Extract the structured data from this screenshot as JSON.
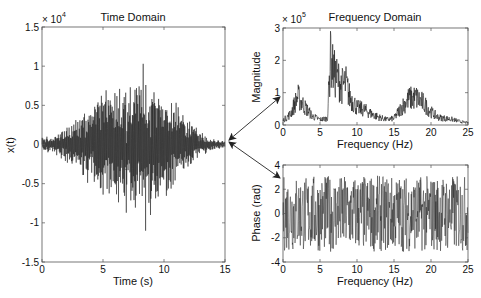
{
  "chart_data": [
    {
      "id": "time",
      "type": "line",
      "title": "Time Domain",
      "xlabel": "Time (s)",
      "ylabel": "x(t)",
      "y_multiplier": "× 10",
      "y_exponent": "4",
      "xlim": [
        0,
        15
      ],
      "ylim": [
        -1.5,
        1.5
      ],
      "xticks": [
        "0",
        "5",
        "10",
        "15"
      ],
      "yticks": [
        "-1.5",
        "-1",
        "-0.5",
        "0",
        "0.5",
        "1",
        "1.5"
      ],
      "grid": false,
      "envelope": {
        "t": [
          0,
          1,
          2,
          3,
          4,
          5,
          6,
          7,
          8,
          9,
          10,
          11,
          12,
          13,
          14,
          15
        ],
        "amp": [
          0.08,
          0.1,
          0.2,
          0.3,
          0.45,
          0.6,
          0.65,
          0.72,
          0.72,
          0.7,
          0.6,
          0.45,
          0.28,
          0.15,
          0.06,
          0.04
        ]
      },
      "peaks": [
        {
          "t": 8.3,
          "value": 1.03
        },
        {
          "t": 8.5,
          "value": -1.1
        },
        {
          "t": 6.9,
          "value": -0.87
        },
        {
          "t": 8.9,
          "value": -0.9
        }
      ]
    },
    {
      "id": "magnitude",
      "type": "line",
      "title": "Frequency Domain",
      "xlabel": "Frequency (Hz)",
      "ylabel": "Magnitude",
      "y_multiplier": "× 10",
      "y_exponent": "5",
      "xlim": [
        0,
        25
      ],
      "ylim": [
        0,
        3
      ],
      "xticks": [
        "0",
        "5",
        "10",
        "15",
        "20",
        "25"
      ],
      "yticks": [
        "0",
        "1",
        "2",
        "3"
      ],
      "grid": false,
      "envelope": {
        "f": [
          0,
          1,
          2,
          3,
          4,
          5,
          6,
          6.4,
          7,
          8,
          8.5,
          9,
          10,
          11,
          12,
          13,
          14,
          15,
          16,
          17,
          18,
          19,
          20,
          21,
          22,
          23,
          24,
          25
        ],
        "amp": [
          0.2,
          0.5,
          1.3,
          0.8,
          0.4,
          0.25,
          0.3,
          2.9,
          2.3,
          1.8,
          1.9,
          1.3,
          0.8,
          0.7,
          0.5,
          0.35,
          0.25,
          0.3,
          0.8,
          1.2,
          1.25,
          1.0,
          0.6,
          0.35,
          0.3,
          0.25,
          0.15,
          0.1
        ]
      }
    },
    {
      "id": "phase",
      "type": "line",
      "title": "",
      "xlabel": "Frequency (Hz)",
      "ylabel": "Phase (rad)",
      "xlim": [
        0,
        25
      ],
      "ylim": [
        -4,
        4
      ],
      "xticks": [
        "0",
        "5",
        "10",
        "15",
        "20",
        "25"
      ],
      "yticks": [
        "-4",
        "-2",
        "0",
        "2",
        "4"
      ],
      "grid": false,
      "range": [
        -3.14,
        3.14
      ]
    }
  ],
  "annotations": {
    "arrows": [
      {
        "from": "time-domain-end",
        "to": "magnitude-plot"
      },
      {
        "from": "time-domain-end",
        "to": "phase-plot"
      }
    ]
  },
  "colors": {
    "line": "#1a1a1a",
    "axes": "#555555",
    "background": "#ffffff"
  }
}
